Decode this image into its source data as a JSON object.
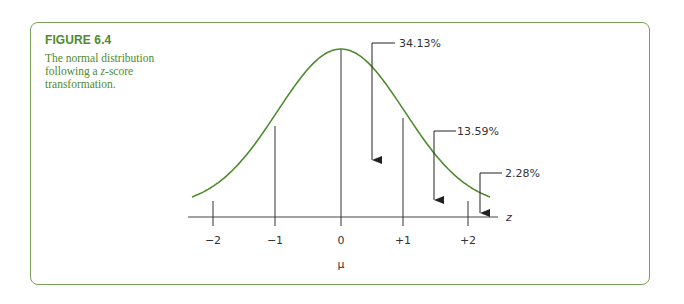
{
  "figure": {
    "title": "FIGURE 6.4",
    "caption_pre": "The normal distribution following a ",
    "caption_z": "z",
    "caption_post": "-score transformation.",
    "accent_color": "#4f8a2e",
    "curve_color": "#4f8a2e"
  },
  "chart_data": {
    "type": "line",
    "title": "The normal distribution following a z-score transformation",
    "xlabel": "z",
    "x_sublabel": "μ",
    "x_ticks": [
      "-2",
      "-1",
      "0",
      "+1",
      "+2"
    ],
    "x_tick_values": [
      -2,
      -1,
      0,
      1,
      2
    ],
    "xlim": [
      -2.4,
      2.4
    ],
    "series": [
      {
        "name": "standard normal density",
        "function": "exp(-z^2/2)/sqrt(2*pi)"
      }
    ],
    "vertical_lines_at": [
      -2,
      -1,
      0,
      1,
      2
    ],
    "annotations": [
      {
        "label": "34.13%",
        "region": [
          0,
          1
        ]
      },
      {
        "label": "13.59%",
        "region": [
          1,
          2
        ]
      },
      {
        "label": "2.28%",
        "region": [
          2,
          "inf"
        ]
      }
    ],
    "grid": false,
    "legend": "none"
  },
  "labels": {
    "axis_name": "z",
    "mu": "μ",
    "ticks": [
      "−2",
      "−1",
      "0",
      "+1",
      "+2"
    ],
    "pct_0_1": "34.13%",
    "pct_1_2": "13.59%",
    "pct_tail": "2.28%"
  }
}
